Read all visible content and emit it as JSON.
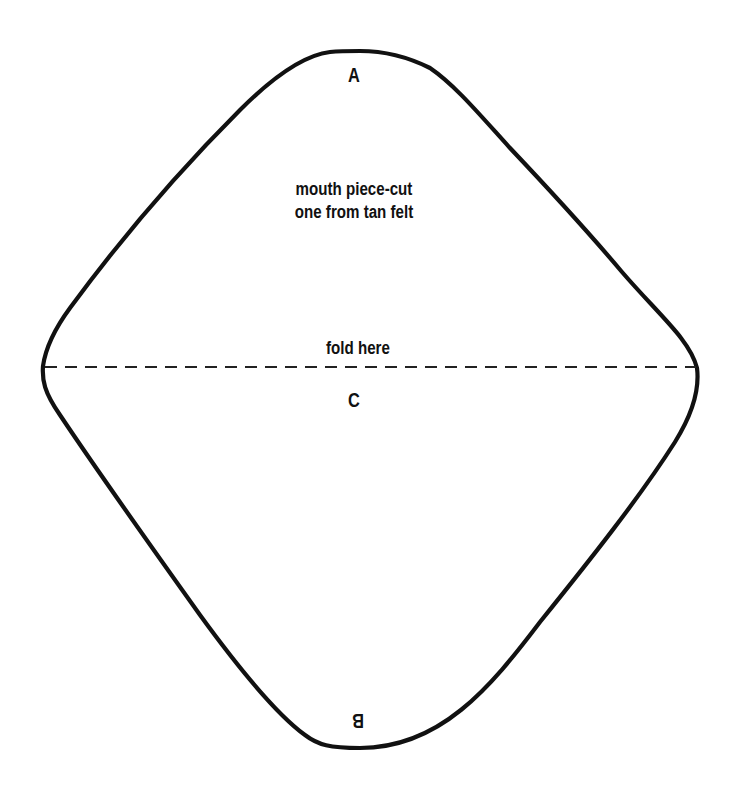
{
  "pattern": {
    "title": "mouth piece pattern",
    "outline_color": "#111111",
    "instruction_lines": [
      "mouth piece-cut",
      "one from tan felt"
    ],
    "fold_label": "fold here",
    "points": {
      "a": "A",
      "b": "B",
      "c": "C"
    }
  }
}
